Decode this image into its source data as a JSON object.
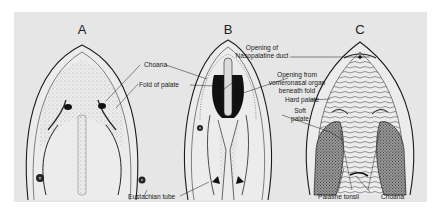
{
  "figure": {
    "panels": [
      {
        "id": "A",
        "letter": "A"
      },
      {
        "id": "B",
        "letter": "B"
      },
      {
        "id": "C",
        "letter": "C"
      }
    ],
    "labels": {
      "choana": "Choana",
      "fold_of_palate": "Fold of palate",
      "eustachian_tube": "Eustachian tube",
      "opening_nasopalatine_line1": "Opening of",
      "opening_nasopalatine_line2": "Nasopalatine duct",
      "opening_vomeronasal_line1": "Opening from",
      "opening_vomeronasal_line2": "vomeronasal organ",
      "opening_vomeronasal_line3": "beneath fold",
      "hard_palate": "Hard palate",
      "soft_palate_line1": "Soft",
      "soft_palate_line2": "palate",
      "palatine_tonsil": "Palatine tonsil",
      "choana_c": "Choana"
    },
    "colors": {
      "background": "#e6e6e6",
      "ink": "#1a1a1a"
    }
  }
}
